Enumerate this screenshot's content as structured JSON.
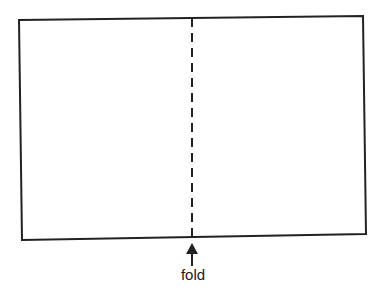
{
  "diagram": {
    "fold_label": "fold",
    "colors": {
      "stroke": "#222222",
      "background": "#ffffff"
    }
  }
}
